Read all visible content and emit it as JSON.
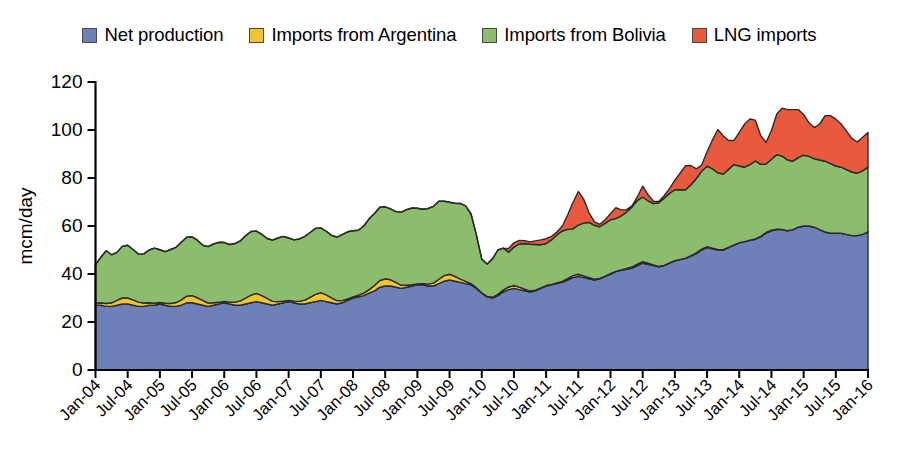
{
  "legend": {
    "position": "top-center",
    "items": [
      {
        "label": "Net production",
        "color": "#6d80b8",
        "icon": "square-swatch-blue"
      },
      {
        "label": "Imports from Argentina",
        "color": "#f4c430",
        "icon": "square-swatch-yellow"
      },
      {
        "label": "Imports from Bolivia",
        "color": "#8cbd6d",
        "icon": "square-swatch-green"
      },
      {
        "label": "LNG imports",
        "color": "#e8593d",
        "icon": "square-swatch-red"
      }
    ]
  },
  "axes": {
    "ylabel": "mcm/day",
    "yticks": [
      "0",
      "20",
      "40",
      "60",
      "80",
      "100",
      "120"
    ],
    "ylim": [
      0,
      120
    ],
    "xticks": [
      "Jan-04",
      "Jul-04",
      "Jan-05",
      "Jul-05",
      "Jan-06",
      "Jul-06",
      "Jan-07",
      "Jul-07",
      "Jan-08",
      "Jul-08",
      "Jan-09",
      "Jul-09",
      "Jan-10",
      "Jul-10",
      "Jan-11",
      "Jul-11",
      "Jan-12",
      "Jul-12",
      "Jan-13",
      "Jul-13",
      "Jan-14",
      "Jul-14",
      "Jan-15",
      "Jul-15",
      "Jan-16"
    ],
    "grid": false
  },
  "chart_data": {
    "type": "area",
    "stacked": true,
    "title": "",
    "xlabel": "",
    "ylabel": "mcm/day",
    "ylim": [
      0,
      120
    ],
    "xlim": [
      "Jan-04",
      "Jan-16"
    ],
    "x_tick_labels": [
      "Jan-04",
      "Jul-04",
      "Jan-05",
      "Jul-05",
      "Jan-06",
      "Jul-06",
      "Jan-07",
      "Jul-07",
      "Jan-08",
      "Jul-08",
      "Jan-09",
      "Jul-09",
      "Jan-10",
      "Jul-10",
      "Jan-11",
      "Jul-11",
      "Jan-12",
      "Jul-12",
      "Jan-13",
      "Jul-13",
      "Jan-14",
      "Jul-14",
      "Jan-15",
      "Jul-15",
      "Jan-16"
    ],
    "x_tick_interval_months": 6,
    "point_interval": "monthly",
    "n_points": 145,
    "series": [
      {
        "name": "Net production",
        "color": "#6d80b8",
        "values": [
          27,
          27,
          26.5,
          26.5,
          27,
          27.5,
          27.5,
          27,
          26.5,
          26.5,
          27,
          27,
          27.5,
          27,
          26.5,
          26.5,
          27,
          28,
          28,
          27.5,
          27,
          26.5,
          27,
          27.5,
          28,
          27.5,
          27,
          27,
          27.5,
          28,
          28.5,
          28,
          27.5,
          27,
          27.5,
          28,
          28.5,
          28,
          27.5,
          27.5,
          28,
          28.5,
          29,
          28.5,
          28,
          27.5,
          28,
          29,
          30,
          30.5,
          31,
          32,
          33,
          34.5,
          35,
          35,
          34.5,
          34,
          34.5,
          35,
          35.5,
          35.5,
          35,
          35,
          36,
          37,
          37.5,
          37,
          36.5,
          36,
          35.5,
          34,
          32,
          30.5,
          30,
          31,
          32.5,
          33.5,
          34,
          33.5,
          33,
          32.5,
          33,
          34,
          35,
          35.5,
          36,
          36.5,
          37.5,
          38.5,
          39,
          38.5,
          38,
          37.5,
          38,
          39,
          40,
          41,
          41.5,
          42,
          42.5,
          43.5,
          44.5,
          44,
          43.5,
          43,
          43.5,
          44.5,
          45.5,
          46,
          46.5,
          47.5,
          48.5,
          50,
          51,
          50.5,
          50,
          50,
          51,
          52,
          53,
          53.5,
          54,
          54.5,
          55.5,
          57,
          58,
          58.5,
          58.5,
          58,
          58.5,
          59.5,
          60,
          60,
          59.5,
          58.5,
          57.5,
          57,
          57,
          57,
          56.5,
          56,
          56,
          56.5,
          57.5
        ]
      },
      {
        "name": "Imports from Argentina",
        "color": "#f4c430",
        "values": [
          0.8,
          1,
          1.2,
          1.5,
          2,
          2.5,
          2.5,
          2.2,
          1.8,
          1.4,
          1,
          0.8,
          0.6,
          0.8,
          1.2,
          1.6,
          2.2,
          2.8,
          3,
          2.6,
          2,
          1.4,
          1,
          0.7,
          0.6,
          0.8,
          1.2,
          1.8,
          2.5,
          3.2,
          3.4,
          3,
          2.3,
          1.6,
          1,
          0.7,
          0.5,
          0.7,
          1.1,
          1.6,
          2.3,
          3,
          3.2,
          2.8,
          2.1,
          1.4,
          0.9,
          0.6,
          0.5,
          0.7,
          1,
          1.5,
          2.2,
          2.8,
          3,
          2.6,
          2,
          1.3,
          0.8,
          0.5,
          0.4,
          0.5,
          0.8,
          1.2,
          1.8,
          2.3,
          2.4,
          2,
          1.4,
          0.9,
          0.5,
          0.3,
          0.2,
          0.2,
          0.3,
          0.5,
          0.8,
          1.1,
          1.2,
          1,
          0.7,
          0.4,
          0.3,
          0.2,
          0.2,
          0.2,
          0.3,
          0.4,
          0.6,
          0.8,
          0.9,
          0.7,
          0.5,
          0.3,
          0.2,
          0.1,
          0.1,
          0.1,
          0.2,
          0.3,
          0.4,
          0.6,
          0.6,
          0.5,
          0.3,
          0.2,
          0.1,
          0.1,
          0.1,
          0.1,
          0.1,
          0.2,
          0.3,
          0.4,
          0.4,
          0.3,
          0.2,
          0.1,
          0.1,
          0.1,
          0,
          0,
          0.1,
          0.1,
          0.2,
          0.3,
          0.3,
          0.2,
          0.1,
          0,
          0,
          0,
          0,
          0,
          0,
          0,
          0,
          0,
          0,
          0,
          0,
          0,
          0,
          0,
          0
        ]
      },
      {
        "name": "Imports from Bolivia",
        "color": "#8cbd6d",
        "values": [
          16,
          19,
          22,
          20,
          20,
          21.5,
          22,
          21,
          20,
          20.5,
          22,
          23,
          22,
          21.5,
          22.5,
          23,
          24,
          24.5,
          24.5,
          24,
          23,
          23.5,
          24.5,
          25,
          24.5,
          24,
          24.5,
          25,
          26,
          26.5,
          26,
          25.5,
          25,
          25.5,
          26.5,
          27,
          26,
          25.5,
          26,
          26.5,
          27,
          27.5,
          27,
          26.5,
          26,
          26.5,
          27.5,
          28,
          27.5,
          27,
          28,
          29.5,
          30,
          30.5,
          30,
          29.5,
          29.5,
          30.5,
          31.5,
          32,
          31.5,
          31,
          31.5,
          32,
          32.5,
          31,
          30,
          30.5,
          31.5,
          31.5,
          29,
          22,
          14,
          13.5,
          16,
          18.5,
          17.5,
          14.5,
          16,
          18,
          19,
          19.5,
          19,
          18,
          17.5,
          18.5,
          20,
          21,
          20.5,
          19.5,
          20.5,
          22,
          23,
          22.5,
          21.5,
          22,
          22.5,
          22,
          22.5,
          23.5,
          25,
          26.5,
          27,
          26,
          25.5,
          26.5,
          28,
          29,
          29.5,
          29,
          28.5,
          29.5,
          31,
          32.5,
          33.5,
          33,
          32,
          31.5,
          32.5,
          33.5,
          32,
          31,
          31.5,
          32.5,
          30,
          28.5,
          29.5,
          31,
          30.5,
          29.5,
          28.5,
          29,
          29.5,
          29,
          28.5,
          29,
          29.5,
          29,
          28,
          27.5,
          27,
          26.5,
          26,
          26.5,
          27
        ]
      },
      {
        "name": "LNG imports",
        "color": "#e8593d",
        "values": [
          0,
          0,
          0,
          0,
          0,
          0,
          0,
          0,
          0,
          0,
          0,
          0,
          0,
          0,
          0,
          0,
          0,
          0,
          0,
          0,
          0,
          0,
          0,
          0,
          0,
          0,
          0,
          0,
          0,
          0,
          0,
          0,
          0,
          0,
          0,
          0,
          0,
          0,
          0,
          0,
          0,
          0,
          0,
          0,
          0,
          0,
          0,
          0,
          0,
          0,
          0,
          0,
          0,
          0,
          0,
          0,
          0,
          0,
          0,
          0,
          0,
          0,
          0,
          0,
          0,
          0,
          0,
          0,
          0,
          0,
          0,
          0,
          0,
          0,
          0,
          0,
          0,
          1.5,
          1.8,
          1.5,
          1.2,
          1,
          1.5,
          2,
          2,
          1.5,
          1.2,
          2,
          6,
          11,
          14,
          10,
          4,
          1.5,
          1,
          1.5,
          2.5,
          4.5,
          2.5,
          1,
          0.5,
          1.5,
          4.5,
          2.5,
          1,
          0.5,
          1,
          2,
          4,
          7,
          10,
          8,
          4,
          2.5,
          6,
          12,
          18,
          16,
          12,
          10,
          14,
          18,
          19,
          17,
          12,
          9,
          12,
          17,
          20,
          21,
          21.5,
          20,
          17,
          14,
          13,
          15,
          19,
          20,
          19.5,
          18,
          16,
          14,
          13,
          14,
          14.5
        ]
      }
    ]
  }
}
